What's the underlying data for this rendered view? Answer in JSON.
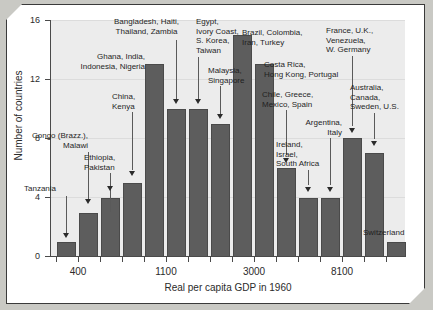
{
  "chart_data": {
    "type": "bar",
    "title": "",
    "xlabel": "Real per capita GDP in 1960",
    "ylabel": "Number of countries",
    "ylim": [
      0,
      16
    ],
    "yticks": [
      0,
      4,
      8,
      12,
      16
    ],
    "ytick_labels": [
      "0",
      "4",
      "8",
      "12",
      "16"
    ],
    "xtick_labels": [
      "400",
      "1100",
      "3000",
      "8100"
    ],
    "grid": true,
    "legend": "none",
    "bar_color": "#5d5d5d",
    "plot_background": "#ececec",
    "categories": [
      "b1",
      "b2",
      "b3",
      "b4",
      "b5",
      "b6",
      "b7",
      "b8",
      "b9",
      "b10",
      "b11",
      "b12",
      "b13",
      "b14",
      "b15",
      "b16"
    ],
    "values": [
      1,
      3,
      4,
      5,
      13,
      10,
      10,
      9,
      15,
      13,
      6,
      4,
      4,
      8,
      7,
      1
    ],
    "annotations": [
      {
        "text": "Tanzania",
        "target_bar": 1,
        "target_value": 1
      },
      {
        "text": "Congo (Brazz.),\nMalawi",
        "target_bar": 2,
        "target_value": 3
      },
      {
        "text": "Ethiopia,\nPakistan",
        "target_bar": 3,
        "target_value": 4
      },
      {
        "text": "China,\nKenya",
        "target_bar": 4,
        "target_value": 5
      },
      {
        "text": "Ghana, India,\nIndonesia, Nigeria",
        "target_bar": 5,
        "target_value": 13
      },
      {
        "text": "Bangladesh, Haiti,\nThailand, Zambia",
        "target_bar": 6,
        "target_value": 10
      },
      {
        "text": "Egypt,\nIvory Coast,\nS. Korea,\nTaiwan",
        "target_bar": 7,
        "target_value": 10
      },
      {
        "text": "Malaysia,\nSingapore",
        "target_bar": 8,
        "target_value": 9
      },
      {
        "text": "Brazil, Colombia,\nIran, Turkey",
        "target_bar": 9,
        "target_value": 15
      },
      {
        "text": "Costa Rica,\nHong Kong, Portugal",
        "target_bar": 10,
        "target_value": 13
      },
      {
        "text": "Chile, Greece,\nMexico, Spain",
        "target_bar": 11,
        "target_value": 6
      },
      {
        "text": "Ireland,\nIsrael,\nSouth Africa",
        "target_bar": 12,
        "target_value": 4
      },
      {
        "text": "Argentina,\nItaly",
        "target_bar": 13,
        "target_value": 4
      },
      {
        "text": "France, U.K.,\nVenezuela,\nW. Germany",
        "target_bar": 14,
        "target_value": 8
      },
      {
        "text": "Australia,\nCanada,\nSweden, U.S.",
        "target_bar": 15,
        "target_value": 7
      },
      {
        "text": "Switzerland",
        "target_bar": 16,
        "target_value": 1
      }
    ]
  },
  "labels": {
    "ylabel": "Number of countries",
    "xlabel": "Real per capita GDP in 1960",
    "y0": "0",
    "y4": "4",
    "y8": "8",
    "y12": "12",
    "y16": "16",
    "x400": "400",
    "x1100": "1100",
    "x3000": "3000",
    "x8100": "8100",
    "a1": "Tanzania",
    "a2_l1": "Congo (Brazz.),",
    "a2_l2": "Malawi",
    "a3_l1": "Ethiopia,",
    "a3_l2": "Pakistan",
    "a4_l1": "China,",
    "a4_l2": "Kenya",
    "a5_l1": "Ghana, India,",
    "a5_l2": "Indonesia, Nigeria",
    "a6_l1": "Bangladesh, Haiti,",
    "a6_l2": "Thailand, Zambia",
    "a7_l1": "Egypt,",
    "a7_l2": "Ivory Coast,",
    "a7_l3": "S. Korea,",
    "a7_l4": "Taiwan",
    "a8_l1": "Malaysia,",
    "a8_l2": "Singapore",
    "a9_l1": "Brazil, Colombia,",
    "a9_l2": "Iran, Turkey",
    "a10_l1": "Costa Rica,",
    "a10_l2": "Hong Kong, Portugal",
    "a11_l1": "Chile, Greece,",
    "a11_l2": "Mexico, Spain",
    "a12_l1": "Ireland,",
    "a12_l2": "Israel,",
    "a12_l3": "South Africa",
    "a13_l1": "Argentina,",
    "a13_l2": "Italy",
    "a14_l1": "France, U.K.,",
    "a14_l2": "Venezuela,",
    "a14_l3": "W. Germany",
    "a15_l1": "Australia,",
    "a15_l2": "Canada,",
    "a15_l3": "Sweden, U.S.",
    "a16": "Switzerland"
  }
}
